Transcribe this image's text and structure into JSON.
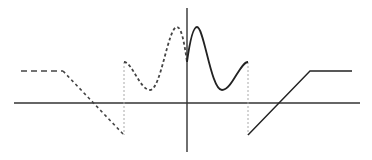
{
  "diagram": {
    "type": "function-plot",
    "colors": {
      "background": "#ffffff",
      "axis": "#333333",
      "solid_curve": "#222222",
      "dashed_curve": "#444444",
      "guide_lines": "#aaaaaa"
    },
    "axes": {
      "x_axis": {
        "x1": 14,
        "y1": 103,
        "x2": 360,
        "y2": 103
      },
      "y_axis": {
        "x1": 187,
        "y1": 8,
        "x2": 187,
        "y2": 152
      }
    },
    "solid_branch": {
      "wave_path": "M187,62 C190,40 193,27 197,27 C204,27 211,90 222,90 C232,90 240,62 248,62",
      "ramp_path": "M248,135 L310,71 L352,71"
    },
    "dashed_branch": {
      "flat_path": "M21,71 L63,71",
      "ramp_path": "M63,71 L124,135",
      "wave_path": "M124,62 C132,62 140,90 150,90 C161,90 168,27 177,27 C181,27 184,40 187,62"
    },
    "guides": [
      {
        "x1": 124,
        "y1": 62,
        "x2": 124,
        "y2": 135
      },
      {
        "x1": 248,
        "y1": 62,
        "x2": 248,
        "y2": 135
      }
    ]
  }
}
